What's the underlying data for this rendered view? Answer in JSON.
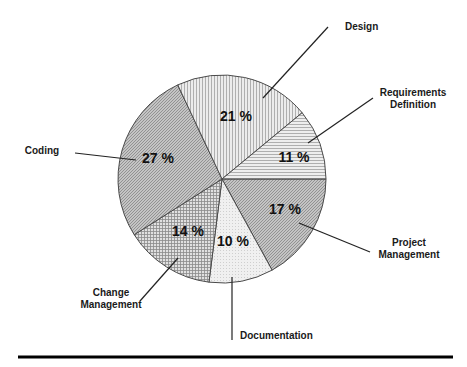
{
  "chart_data": {
    "type": "pie",
    "title": "",
    "center": [
      222,
      179
    ],
    "radius": 104,
    "start_angle_deg": 0,
    "direction": "clockwise",
    "slices": [
      {
        "name": "Project Management",
        "label_lines": [
          "Project",
          "Management"
        ],
        "value": 17,
        "value_label": "17 %",
        "pattern": "diag-dense",
        "fill": "#b9b9b9"
      },
      {
        "name": "Documentation",
        "label_lines": [
          "Documentation"
        ],
        "value": 10,
        "value_label": "10 %",
        "pattern": "dots-light",
        "fill": "#ececec"
      },
      {
        "name": "Change Management",
        "label_lines": [
          "Change",
          "Management"
        ],
        "value": 14,
        "value_label": "14 %",
        "pattern": "grid",
        "fill": "#cfcfcf"
      },
      {
        "name": "Coding",
        "label_lines": [
          "Coding"
        ],
        "value": 27,
        "value_label": "27 %",
        "pattern": "diag-dense",
        "fill": "#bdbdbd"
      },
      {
        "name": "Design",
        "label_lines": [
          "Design"
        ],
        "value": 21,
        "value_label": "21 %",
        "pattern": "vertical",
        "fill": "#e2e2e2"
      },
      {
        "name": "Requirements Definition",
        "label_lines": [
          "Requirements",
          "Definition"
        ],
        "value": 11,
        "value_label": "11 %",
        "pattern": "horizontal",
        "fill": "#e4e4e4"
      }
    ],
    "legend": "none (leader-line callouts)",
    "grid": false
  },
  "callouts": [
    {
      "slice": "Design",
      "line": [
        263,
        98,
        328,
        27
      ],
      "text_x": 345,
      "text_y": 30,
      "anchor": "start"
    },
    {
      "slice": "Requirements Definition",
      "line": [
        308,
        143,
        373,
        98
      ],
      "text_x": 413,
      "text_y": 96,
      "anchor": "middle"
    },
    {
      "slice": "Project Management",
      "line": [
        299,
        223,
        370,
        252
      ],
      "text_x": 409,
      "text_y": 246,
      "anchor": "middle"
    },
    {
      "slice": "Documentation",
      "line": [
        232,
        277,
        232,
        340
      ],
      "text_x": 240,
      "text_y": 339,
      "anchor": "start"
    },
    {
      "slice": "Change Management",
      "line": [
        178,
        258,
        140,
        301
      ],
      "text_x": 111,
      "text_y": 296,
      "anchor": "middle"
    },
    {
      "slice": "Coding",
      "line": [
        75,
        153,
        136,
        160
      ],
      "text_x": 42,
      "text_y": 154,
      "anchor": "middle"
    }
  ],
  "value_label_positions": {
    "Project Management": [
      285,
      214
    ],
    "Documentation": [
      233,
      246
    ],
    "Change Management": [
      188,
      236
    ],
    "Coding": [
      158,
      163
    ],
    "Design": [
      236,
      121
    ],
    "Requirements Definition": [
      294,
      162
    ]
  },
  "footer_rule": {
    "x1": 18,
    "x2": 453,
    "y": 357,
    "color": "#000000"
  }
}
